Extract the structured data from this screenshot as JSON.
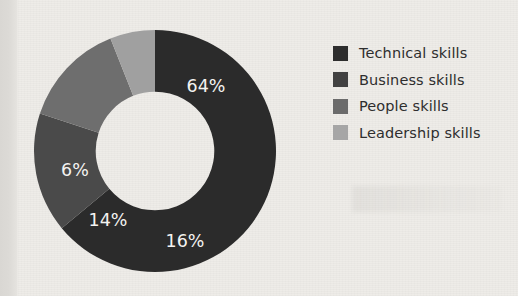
{
  "chart_data": {
    "type": "pie",
    "variant": "donut",
    "title": "",
    "xlabel": "",
    "ylabel": "",
    "categories": [
      "Technical skills",
      "Business skills",
      "People skills",
      "Leadership skills"
    ],
    "values": [
      64,
      16,
      14,
      6
    ],
    "value_labels": [
      "64%",
      "16%",
      "14%",
      "6%"
    ],
    "unit": "%",
    "total": 100,
    "start_angle_deg": 0,
    "direction": "clockwise",
    "inner_radius_ratio": 0.49,
    "legend_position": "right",
    "grid": false,
    "data_labels_inside": true,
    "data_label_color": "#f4f3f1",
    "slices": [
      {
        "label": "Technical skills",
        "value": 64,
        "display": "64%",
        "color": "#2b2b2b",
        "label_x": 173,
        "label_y": 58
      },
      {
        "label": "Business skills",
        "value": 16,
        "display": "16%",
        "color": "#4a4a4a",
        "label_x": 152,
        "label_y": 213
      },
      {
        "label": "People skills",
        "value": 14,
        "display": "14%",
        "color": "#6e6e6e",
        "label_x": 75,
        "label_y": 192
      },
      {
        "label": "Leadership skills",
        "value": 6,
        "display": "6%",
        "color": "#a0a0a0",
        "label_x": 42,
        "label_y": 142
      }
    ]
  },
  "legend": {
    "items": [
      {
        "label": "Technical skills",
        "color": "#2d2d2d"
      },
      {
        "label": "Business skills",
        "color": "#414141"
      },
      {
        "label": "People skills",
        "color": "#6b6b6b"
      },
      {
        "label": "Leadership skills",
        "color": "#a6a6a6"
      }
    ]
  },
  "page": {
    "background_color": "#eeece8",
    "margin_strip_color": "#dcdad6"
  }
}
